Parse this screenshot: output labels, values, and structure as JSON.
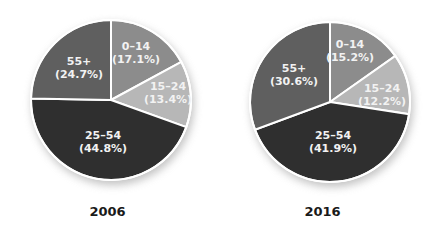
{
  "chart_data": [
    {
      "type": "pie",
      "title": "2006",
      "categories": [
        "0–14",
        "15–24",
        "25–54",
        "55+"
      ],
      "values": [
        17.1,
        13.4,
        44.8,
        24.7
      ],
      "labels": [
        "(17.1%)",
        "(13.4%)",
        "(44.8%)",
        "(24.7%)"
      ],
      "colors": [
        "#8c8c8c",
        "#b7b7b7",
        "#2f2f2f",
        "#5f5f5f"
      ],
      "start_angle": "12 o'clock, clockwise",
      "legend": "none (labels inside slices)"
    },
    {
      "type": "pie",
      "title": "2016",
      "categories": [
        "0–14",
        "15–24",
        "25–54",
        "55+"
      ],
      "values": [
        15.2,
        12.2,
        41.9,
        30.6
      ],
      "labels": [
        "(15.2%)",
        "(12.2%)",
        "(41.9%)",
        "(30.6%)"
      ],
      "colors": [
        "#8c8c8c",
        "#b7b7b7",
        "#2f2f2f",
        "#5f5f5f"
      ],
      "start_angle": "12 o'clock, clockwise",
      "legend": "none (labels inside slices)"
    }
  ],
  "charts": [
    {
      "year": "2006",
      "slices": [
        {
          "name": "0–14",
          "pct": "(17.1%)"
        },
        {
          "name": "15–24",
          "pct": "(13.4%)"
        },
        {
          "name": "25–54",
          "pct": "(44.8%)"
        },
        {
          "name": "55+",
          "pct": "(24.7%)"
        }
      ]
    },
    {
      "year": "2016",
      "slices": [
        {
          "name": "0–14",
          "pct": "(15.2%)"
        },
        {
          "name": "15–24",
          "pct": "(12.2%)"
        },
        {
          "name": "25–54",
          "pct": "(41.9%)"
        },
        {
          "name": "55+",
          "pct": "(30.6%)"
        }
      ]
    }
  ]
}
